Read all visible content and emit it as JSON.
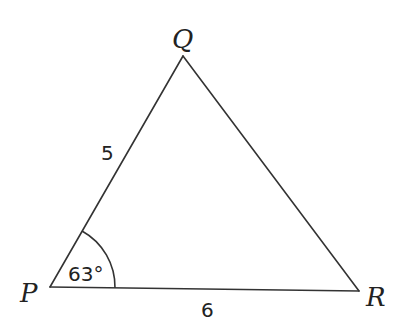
{
  "diagram": {
    "type": "triangle",
    "vertices": {
      "P": {
        "label": "P",
        "x": 50,
        "y": 287
      },
      "Q": {
        "label": "Q",
        "x": 183,
        "y": 56
      },
      "R": {
        "label": "R",
        "x": 359,
        "y": 291
      }
    },
    "sides": {
      "PQ": {
        "label": "5"
      },
      "PR": {
        "label": "6"
      }
    },
    "angles": {
      "P": {
        "label": "63°",
        "value_degrees": 63
      }
    },
    "colors": {
      "stroke": "#333333",
      "text": "#222222",
      "background": "#ffffff"
    }
  }
}
